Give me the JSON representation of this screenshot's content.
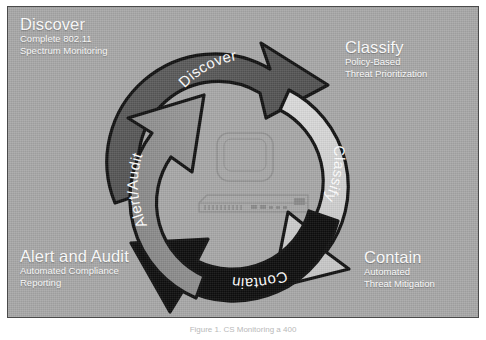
{
  "figure": {
    "caption": "Figure 1.  CS Monitoring a 400",
    "panel_color": "#a8a8a8",
    "border_color": "#4a4a4a"
  },
  "quadrants": [
    {
      "key": "discover",
      "title": "Discover",
      "line1": "Complete 802.11",
      "line2": "Spectrum Monitoring"
    },
    {
      "key": "classify",
      "title": "Classify",
      "line1": "Policy-Based",
      "line2": "Threat Prioritization"
    },
    {
      "key": "alert_and_audit",
      "title": "Alert and Audit",
      "line1": "Automated Compliance",
      "line2": "Reporting"
    },
    {
      "key": "contain",
      "title": "Contain",
      "line1": "Automated",
      "line2": "Threat Mitigation"
    }
  ],
  "cycle": {
    "segments": [
      {
        "key": "discover",
        "label": "Discover",
        "fill": "#555555",
        "text_color": "#ffffff"
      },
      {
        "key": "classify",
        "label": "Classify",
        "fill": "#d2d2d2",
        "text_color": "#ffffff"
      },
      {
        "key": "contain",
        "label": "Contain",
        "fill": "#0d0d0d",
        "text_color": "#ffffff"
      },
      {
        "key": "alert_audit",
        "label": "Alert/Audit",
        "fill": "#8e8e8e",
        "text_color": "#ffffff"
      }
    ],
    "direction": "clockwise"
  },
  "center_device": {
    "monitor_label": "",
    "appliance_label": ""
  }
}
